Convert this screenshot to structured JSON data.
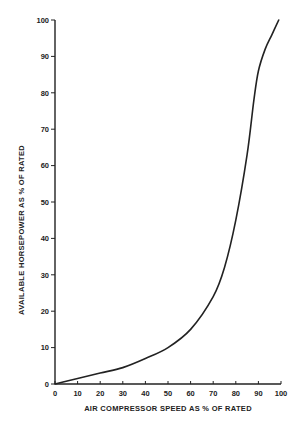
{
  "chart_data": {
    "type": "line",
    "title": "",
    "xlabel": "AIR COMPRESSOR SPEED AS % OF RATED",
    "ylabel": "AVAILABLE HORSEPOWER AS % OF RATED",
    "xlim": [
      0,
      100
    ],
    "ylim": [
      0,
      100
    ],
    "x_ticks": [
      0,
      10,
      20,
      30,
      40,
      50,
      60,
      70,
      80,
      90,
      100
    ],
    "y_ticks": [
      0,
      10,
      20,
      30,
      40,
      50,
      60,
      70,
      80,
      90,
      100
    ],
    "grid": false,
    "legend": null,
    "series": [
      {
        "name": "Available horsepower",
        "color": "#222222",
        "x": [
          0,
          10,
          20,
          30,
          40,
          50,
          60,
          70,
          75,
          80,
          85,
          88,
          90,
          93,
          96,
          99
        ],
        "y": [
          0,
          1.5,
          3,
          4.5,
          7,
          10,
          15,
          24,
          32,
          45,
          63,
          78,
          86,
          92,
          96,
          100
        ]
      }
    ]
  },
  "layout": {
    "origin_px": [
      55,
      384
    ],
    "x_px_per_unit": 2.26,
    "y_px_per_unit": 3.64
  }
}
